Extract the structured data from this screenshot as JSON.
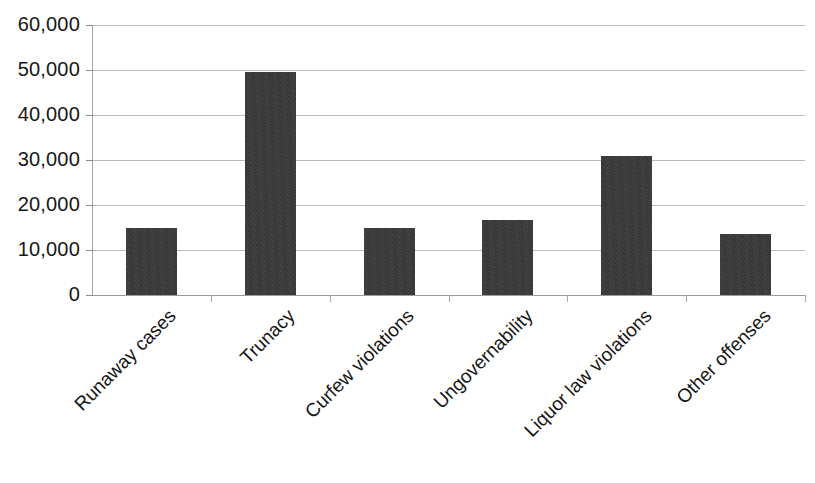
{
  "chart_data": {
    "type": "bar",
    "title": "",
    "subtitle": "",
    "xlabel": "",
    "ylabel": "",
    "categories": [
      "Runaway cases",
      "Trunacy",
      "Curfew violations",
      "Ungovernability",
      "Liquor law violations",
      "Other offenses"
    ],
    "values": [
      15000,
      49500,
      14800,
      16700,
      31000,
      13500
    ],
    "ylim": [
      0,
      60000
    ],
    "ytick_values": [
      0,
      10000,
      20000,
      30000,
      40000,
      50000,
      60000
    ],
    "ytick_labels": [
      "0",
      "10,000",
      "20,000",
      "30,000",
      "40,000",
      "50,000",
      "60,000"
    ],
    "grid": true,
    "grid_axis": "y",
    "legend": false,
    "legend_position": "none",
    "bar_color": "#343434",
    "gridline_color": "#b9b9b9",
    "axis_color": "#a5a5a5",
    "text_color": "#161616",
    "background_color": "#ffffff",
    "xtick_label_rotation": -45
  },
  "caption": {
    "clipped_text": ""
  }
}
